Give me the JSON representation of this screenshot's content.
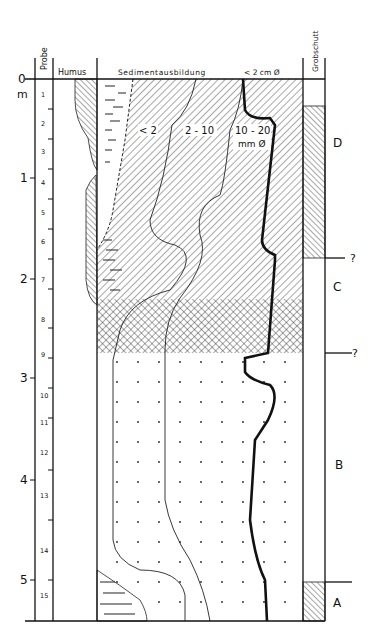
{
  "headers": {
    "probe": "Probe",
    "humus": "Humus",
    "sediment": "Sedimentausbildung",
    "fraction": "< 2 cm Ø",
    "grobschutt": "Grobschutt"
  },
  "depth_axis": {
    "unit": "m",
    "ticks": [
      "0",
      "1",
      "2",
      "3",
      "4",
      "5"
    ]
  },
  "samples": [
    "1",
    "2",
    "3",
    "4",
    "5",
    "6",
    "7",
    "8",
    "9",
    "10",
    "11",
    "12",
    "13",
    "14",
    "15"
  ],
  "fraction_labels": {
    "lt2": "< 2",
    "f2_10": "2 - 10",
    "f10_20": "10 - 20",
    "unit": "mm Ø"
  },
  "units": [
    {
      "label": "D"
    },
    {
      "label": "?"
    },
    {
      "label": "C"
    },
    {
      "label": "?"
    },
    {
      "label": "B"
    },
    {
      "label": "A"
    }
  ]
}
